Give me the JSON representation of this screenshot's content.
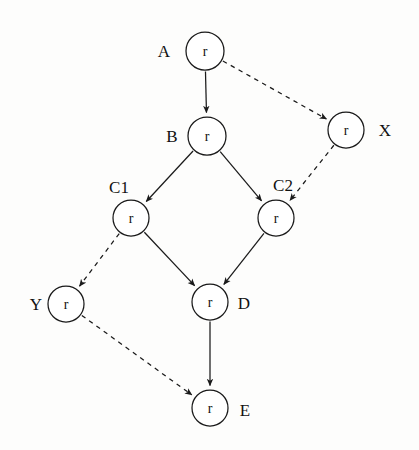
{
  "diagram": {
    "title": "",
    "background_color": "#fdfdfc",
    "stroke_color": "#1a1a1a",
    "node_fill": "#ffffff",
    "width": 419,
    "height": 450,
    "node_radius": 18,
    "nodes": [
      {
        "id": "A",
        "label": "A",
        "inner_text": "r",
        "cx": 205,
        "cy": 51,
        "r": 19,
        "label_x": 164,
        "label_y": 51,
        "label_anchor": "middle"
      },
      {
        "id": "X",
        "label": "X",
        "inner_text": "r",
        "cx": 346,
        "cy": 130,
        "r": 18,
        "label_x": 385,
        "label_y": 130,
        "label_anchor": "middle"
      },
      {
        "id": "B",
        "label": "B",
        "inner_text": "r",
        "cx": 207,
        "cy": 136,
        "r": 19,
        "label_x": 172,
        "label_y": 136,
        "label_anchor": "middle"
      },
      {
        "id": "C1",
        "label": "C1",
        "inner_text": "r",
        "cx": 131,
        "cy": 218,
        "r": 18,
        "label_x": 119,
        "label_y": 187,
        "label_anchor": "middle"
      },
      {
        "id": "C2",
        "label": "C2",
        "inner_text": "r",
        "cx": 276,
        "cy": 218,
        "r": 18,
        "label_x": 283,
        "label_y": 185,
        "label_anchor": "middle"
      },
      {
        "id": "Y",
        "label": "Y",
        "inner_text": "r",
        "cx": 66,
        "cy": 304,
        "r": 18,
        "label_x": 36,
        "label_y": 304,
        "label_anchor": "middle"
      },
      {
        "id": "D",
        "label": "D",
        "inner_text": "r",
        "cx": 210,
        "cy": 302,
        "r": 18,
        "label_x": 244,
        "label_y": 303,
        "label_anchor": "middle"
      },
      {
        "id": "E",
        "label": "E",
        "inner_text": "r",
        "cx": 210,
        "cy": 408,
        "r": 18,
        "label_x": 245,
        "label_y": 410,
        "label_anchor": "middle"
      }
    ],
    "edges": [
      {
        "id": "A-B",
        "from": "A",
        "to": "B",
        "style": "solid",
        "arrow": true
      },
      {
        "id": "A-X",
        "from": "A",
        "to": "X",
        "style": "dashed",
        "arrow": true
      },
      {
        "id": "B-C1",
        "from": "B",
        "to": "C1",
        "style": "solid",
        "arrow": true
      },
      {
        "id": "B-C2",
        "from": "B",
        "to": "C2",
        "style": "solid",
        "arrow": true
      },
      {
        "id": "X-C2",
        "from": "X",
        "to": "C2",
        "style": "dashed",
        "arrow": true
      },
      {
        "id": "C1-Y",
        "from": "C1",
        "to": "Y",
        "style": "dashed",
        "arrow": true
      },
      {
        "id": "C1-D",
        "from": "C1",
        "to": "D",
        "style": "solid",
        "arrow": true
      },
      {
        "id": "C2-D",
        "from": "C2",
        "to": "D",
        "style": "solid",
        "arrow": true
      },
      {
        "id": "D-E",
        "from": "D",
        "to": "E",
        "style": "solid",
        "arrow": true
      },
      {
        "id": "Y-E",
        "from": "Y",
        "to": "E",
        "style": "dashed",
        "arrow": true
      }
    ]
  }
}
